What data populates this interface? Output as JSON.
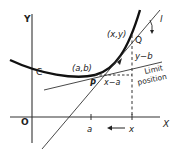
{
  "diagram": {
    "axes": {
      "y_label": "Y",
      "x_label": "X",
      "origin_label": "O"
    },
    "curve_label": "C",
    "point_p": {
      "label": "P",
      "coords": "(a,b)"
    },
    "point_q": {
      "label": "Q",
      "coords": "(x,y)"
    },
    "secant_label": "l",
    "vertical_diff": "y−b",
    "horizontal_diff": "x−a",
    "tangent_label_line1": "Limit",
    "tangent_label_line2": "position",
    "x_ticks": [
      {
        "label": "a"
      },
      {
        "label": "x"
      }
    ],
    "arrow_direction": "x toward a"
  }
}
